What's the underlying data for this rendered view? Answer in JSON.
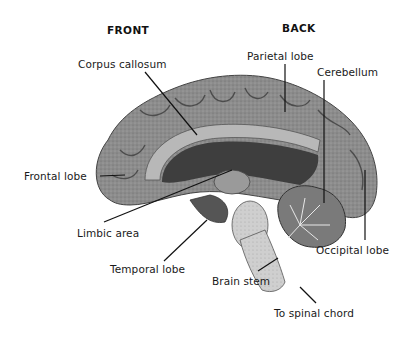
{
  "headings": {
    "front": "FRONT",
    "back": "BACK"
  },
  "labels": [
    {
      "id": "corpus-callosum",
      "text": "Corpus callosum"
    },
    {
      "id": "parietal-lobe",
      "text": "Parietal lobe"
    },
    {
      "id": "cerebellum",
      "text": "Cerebellum"
    },
    {
      "id": "frontal-lobe",
      "text": "Frontal lobe"
    },
    {
      "id": "limbic-area",
      "text": "Limbic area"
    },
    {
      "id": "temporal-lobe",
      "text": "Temporal lobe"
    },
    {
      "id": "occipital-lobe",
      "text": "Occipital lobe"
    },
    {
      "id": "brain-stem",
      "text": "Brain stem"
    },
    {
      "id": "spinal-chord",
      "text": "To spinal chord"
    }
  ],
  "colors": {
    "cortex": "#8a8a8a",
    "cortex_dark": "#555555",
    "ventricle": "#3a3a3a",
    "stem": "#d8d8d8",
    "line": "#111111"
  }
}
